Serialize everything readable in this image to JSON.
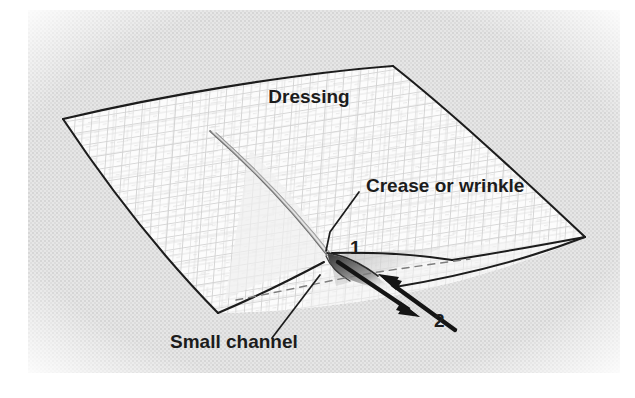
{
  "figure": {
    "type": "line-art-medical-illustration",
    "background_color": "#e3e3e3",
    "page_color": "#ffffff",
    "ink_color": "#1c1c1c",
    "texture_color": "#c9c9c9",
    "sheet_fill": "#fbfbfb",
    "shadow_color": "#5a5a5a"
  },
  "labels": {
    "dressing": "Dressing",
    "crease": "Crease or wrinkle",
    "channel": "Small channel",
    "arrow_one": "1",
    "arrow_two": "2"
  },
  "annotations": [
    {
      "name": "dressing",
      "text": "Dressing",
      "x": 309,
      "y": 103,
      "leader": false
    },
    {
      "name": "crease-or-wrinkle",
      "text": "Crease or wrinkle",
      "x": 361,
      "y": 186,
      "leader": true
    },
    {
      "name": "small-channel",
      "text": "Small channel",
      "x": 170,
      "y": 348,
      "leader": true
    },
    {
      "name": "arrow-1",
      "text": "1",
      "x": 350,
      "y": 254,
      "leader": false
    },
    {
      "name": "arrow-2",
      "text": "2",
      "x": 434,
      "y": 327,
      "leader": false
    }
  ],
  "geometry": {
    "sheet_corners": {
      "left": [
        63,
        119
      ],
      "top": [
        393,
        66
      ],
      "right": [
        585,
        237
      ],
      "bottom": [
        218,
        313
      ]
    },
    "crease_start": [
      210,
      131
    ],
    "crease_apex": [
      330,
      255
    ],
    "arrow1_from": [
      338,
      262
    ],
    "arrow1_to": [
      418,
      316
    ],
    "arrow2_from": [
      455,
      330
    ],
    "arrow2_to": [
      372,
      273
    ]
  }
}
